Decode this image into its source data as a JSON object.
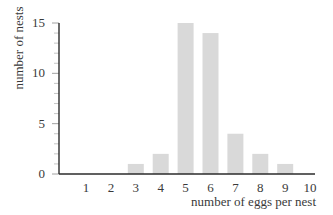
{
  "chart_data": {
    "type": "bar",
    "title": "",
    "xlabel": "number of eggs per nest",
    "ylabel": "number of nests",
    "categories": [
      "1",
      "2",
      "3",
      "4",
      "5",
      "6",
      "7",
      "8",
      "9",
      "10"
    ],
    "values": [
      0,
      0,
      1,
      2,
      15,
      14,
      4,
      2,
      1,
      0
    ],
    "ylim": [
      0,
      15
    ],
    "yticks": [
      0,
      5,
      10,
      15
    ],
    "yminor_tick_step": 1,
    "grid": false,
    "legend": null,
    "colors": {
      "bar": "#d9d9d9",
      "axis": "#2b2b2b",
      "text": "#3a3a3a"
    }
  }
}
